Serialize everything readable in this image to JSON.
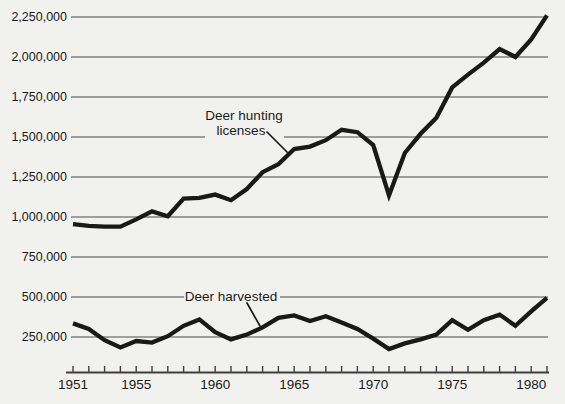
{
  "chart_data": {
    "type": "line",
    "title": "",
    "xlabel": "",
    "ylabel": "",
    "x_range": [
      1951,
      1981
    ],
    "ylim": [
      0,
      2300000
    ],
    "grid": "horizontal gridlines only",
    "legend_position": "inline annotations with pointer lines",
    "ink_color": "#191919",
    "background_color": "#f1f1ee",
    "x": [
      1951,
      1952,
      1953,
      1954,
      1955,
      1956,
      1957,
      1958,
      1959,
      1960,
      1961,
      1962,
      1963,
      1964,
      1965,
      1966,
      1967,
      1968,
      1969,
      1970,
      1971,
      1972,
      1973,
      1974,
      1975,
      1976,
      1977,
      1978,
      1979,
      1980,
      1981
    ],
    "series": [
      {
        "key": "licenses",
        "name": "Deer hunting licenses",
        "values": [
          955000,
          945000,
          940000,
          940000,
          985000,
          1035000,
          1005000,
          1115000,
          1120000,
          1140000,
          1105000,
          1175000,
          1280000,
          1330000,
          1425000,
          1440000,
          1480000,
          1545000,
          1530000,
          1450000,
          1135000,
          1400000,
          1520000,
          1620000,
          1810000,
          1890000,
          1965000,
          2050000,
          2000000,
          2110000,
          2260000
        ]
      },
      {
        "key": "harvested",
        "name": "Deer harvested",
        "values": [
          335000,
          300000,
          230000,
          185000,
          225000,
          215000,
          255000,
          320000,
          360000,
          280000,
          235000,
          265000,
          310000,
          370000,
          385000,
          350000,
          380000,
          340000,
          300000,
          240000,
          175000,
          210000,
          235000,
          265000,
          355000,
          295000,
          355000,
          390000,
          320000,
          410000,
          495000
        ]
      }
    ],
    "y_ticks": [
      {
        "value": 2250000,
        "label": "2,250,000"
      },
      {
        "value": 2000000,
        "label": "2,000,000"
      },
      {
        "value": 1750000,
        "label": "1,750,000"
      },
      {
        "value": 1500000,
        "label": "1,500,000"
      },
      {
        "value": 1250000,
        "label": "1,250,000"
      },
      {
        "value": 1000000,
        "label": "1,000,000"
      },
      {
        "value": 750000,
        "label": "750,000"
      },
      {
        "value": 500000,
        "label": "500,000"
      },
      {
        "value": 250000,
        "label": "250,000"
      }
    ],
    "x_tick_step": 1,
    "x_tick_years": [
      1951,
      1955,
      1960,
      1965,
      1970,
      1975,
      1980
    ],
    "x_tick_labels": [
      "1951",
      "1955",
      "1960",
      "1965",
      "1970",
      "1975",
      "1980"
    ],
    "annotations": {
      "licenses_line1": "Deer hunting",
      "licenses_line2": "licenses",
      "harvested": "Deer harvested"
    }
  }
}
